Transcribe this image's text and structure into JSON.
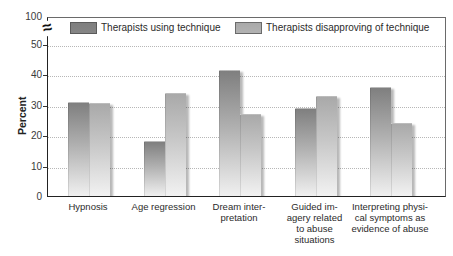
{
  "chart_data": {
    "type": "bar",
    "title": "",
    "xlabel": "",
    "ylabel": "Percent",
    "categories": [
      "Hypnosis",
      "Age regression",
      "Dream inter-\npretation",
      "Guided im-\nagery related\nto abuse\nsituations",
      "Interpreting physi-\ncal symptoms as\nevidence of abuse"
    ],
    "series": [
      {
        "name": "Therapists using technique",
        "values": [
          31,
          18,
          41.5,
          29,
          36
        ],
        "swatch_color": "#858585",
        "gradient_top": "#7f7f7f",
        "gradient_mid": "#b0b0b0",
        "gradient_bottom": "#f0f0f0"
      },
      {
        "name": "Therapists disapproving of technique",
        "values": [
          30.5,
          34,
          27,
          33,
          24
        ],
        "swatch_color": "#b2b2b2",
        "gradient_top": "#a9a9a9",
        "gradient_mid": "#c8c8c8",
        "gradient_bottom": "#f2f2f2"
      }
    ],
    "y_ticks": [
      0,
      10,
      20,
      30,
      40,
      50
    ],
    "y_axis_break": true,
    "y_top_label": "100",
    "ylim": [
      0,
      50
    ],
    "grid": "horizontal dotted",
    "gridline_color": "#b7b7b7",
    "legend_position": "top inside",
    "axis_break_glyph": "≈"
  }
}
